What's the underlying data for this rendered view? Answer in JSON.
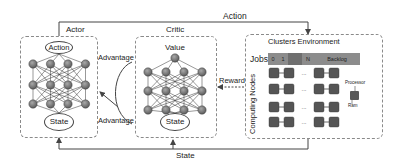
{
  "diagram": {
    "type": "actor-critic reinforcement learning for cluster scheduling",
    "actor": {
      "title": "Actor",
      "output_node": "Action",
      "input_node": "State",
      "layers": 3,
      "nodes_per_layer": 4
    },
    "critic": {
      "title": "Critic",
      "output_node": "Value",
      "input_node": "State",
      "layers": 3,
      "nodes_per_layer": 4
    },
    "environment": {
      "title": "Clusters Environment",
      "jobs_label": "Jobs",
      "job_slots": [
        "0",
        "1",
        "...",
        "N",
        "Backlog"
      ],
      "nodes_label": "Computing Nodes",
      "legend": {
        "processor_label": "Processor",
        "ram_label": "Ram"
      },
      "grid_rows": 4,
      "grid_cols": 4
    },
    "edges": {
      "action": "Action",
      "state": "State",
      "reward": "Reward",
      "advantage_top": "Advantage",
      "advantage_bottom": "Advantage"
    },
    "colors": {
      "node_fill": "#6e6e6e",
      "job_bar": "#8c8c8c",
      "line": "#444444",
      "dash": "#8a8a8a"
    }
  }
}
